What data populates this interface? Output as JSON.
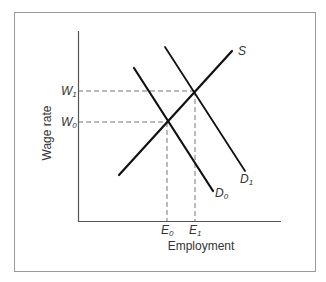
{
  "diagram": {
    "type": "supply-demand",
    "y_axis_label": "Wage rate",
    "x_axis_label": "Employment",
    "y_ticks": [
      {
        "label": "W",
        "sub": "1",
        "y": 91
      },
      {
        "label": "W",
        "sub": "0",
        "y": 122
      }
    ],
    "x_ticks": [
      {
        "label": "E",
        "sub": "0",
        "x": 167
      },
      {
        "label": "E",
        "sub": "1",
        "x": 195
      }
    ],
    "curves": [
      {
        "name": "S",
        "label": "S",
        "sub": ""
      },
      {
        "name": "D0",
        "label": "D",
        "sub": "0"
      },
      {
        "name": "D1",
        "label": "D",
        "sub": "1"
      }
    ],
    "equilibria": [
      {
        "name": "initial",
        "wage": "W0",
        "employment": "E0"
      },
      {
        "name": "new",
        "wage": "W1",
        "employment": "E1"
      }
    ]
  },
  "colors": {
    "line": "#111111",
    "frame": "#9a9a9a",
    "axis": "#555555",
    "dash": "#666666",
    "text": "#333333"
  }
}
